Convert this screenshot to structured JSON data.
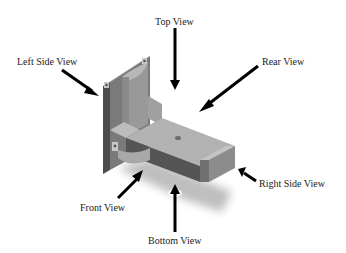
{
  "diagram": {
    "type": "orthographic-views-isometric",
    "labels": {
      "top": "Top View",
      "left": "Left Side View",
      "rear": "Rear View",
      "right": "Right Side View",
      "front": "Front View",
      "bottom": "Bottom View"
    },
    "colors": {
      "background": "#ffffff",
      "arrow": "#000000",
      "text": "#1a1a1a",
      "part_light": "#b4b4b4",
      "part_mid": "#8c8c8c",
      "part_dark": "#555555",
      "shadow": "#9a9a9a"
    }
  }
}
